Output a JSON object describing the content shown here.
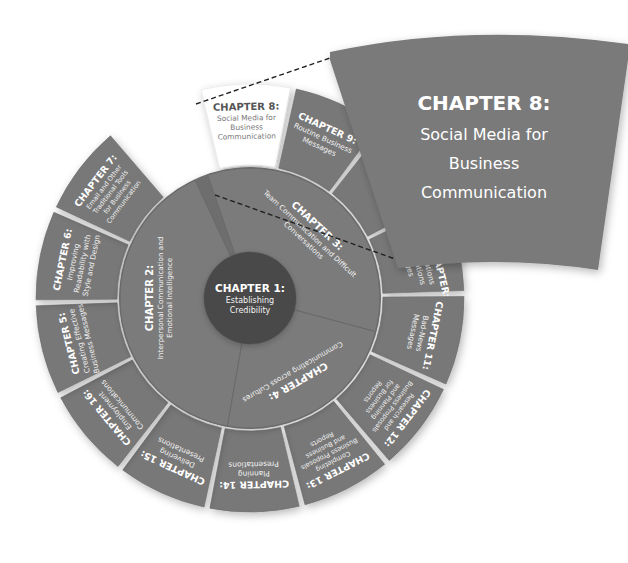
{
  "colors": {
    "center": "#4a4a4a",
    "middle_ring": "#7b7b7b",
    "outer_tile": "#787878",
    "highlight_tile": "#ffffff",
    "callout": "#7a7a7a",
    "text_light": "#ffffff",
    "text_dark": "#555555",
    "dashed_line": "#222222"
  },
  "center": {
    "title": "CHAPTER 1:",
    "lines": [
      "Establishing",
      "Credibility"
    ]
  },
  "middle_ring": [
    {
      "id": "ch2",
      "title": "CHAPTER 2:",
      "lines": [
        "Interpersonal Communication and",
        "Emotional Intelligence"
      ]
    },
    {
      "id": "ch3",
      "title": "CHAPTER 3:",
      "lines": [
        "Team Communication and Difficult",
        "Conversations"
      ]
    },
    {
      "id": "ch4",
      "title": "CHAPTER 4:",
      "lines": [
        "Communicating across Cultures"
      ]
    }
  ],
  "outer_ring": [
    {
      "id": "ch8",
      "title": "CHAPTER 8:",
      "lines": [
        "Social Media for",
        "Business",
        "Communication"
      ],
      "highlighted": true
    },
    {
      "id": "ch9",
      "title": "CHAPTER 9:",
      "lines": [
        "Routine Business",
        "Messages"
      ]
    },
    {
      "id": "ch10",
      "title": "",
      "lines": []
    },
    {
      "id": "bonus",
      "title": "BONUS CHAPTER:",
      "lines": [
        "Communications",
        "Public Relations",
        "Messages"
      ]
    },
    {
      "id": "ch11",
      "title": "CHAPTER 11:",
      "lines": [
        "Bad-News",
        "Messages"
      ]
    },
    {
      "id": "ch12",
      "title": "CHAPTER 12:",
      "lines": [
        "Research and",
        "Business Proposals",
        "and Planning",
        "for Business",
        "Reports"
      ]
    },
    {
      "id": "ch13",
      "title": "CHAPTER 13:",
      "lines": [
        "Completing",
        "Business Proposals",
        "and Business",
        "Reports"
      ]
    },
    {
      "id": "ch14",
      "title": "CHAPTER 14:",
      "lines": [
        "Planning",
        "Presentations"
      ]
    },
    {
      "id": "ch15",
      "title": "CHAPTER 15:",
      "lines": [
        "Delivering",
        "Presentations"
      ]
    },
    {
      "id": "ch16",
      "title": "CHAPTER 16:",
      "lines": [
        "Employment",
        "Communications"
      ]
    },
    {
      "id": "ch5",
      "title": "CHAPTER 5:",
      "lines": [
        "Creating Effective",
        "Business Messages"
      ]
    },
    {
      "id": "ch6",
      "title": "CHAPTER 6:",
      "lines": [
        "Improving",
        "Readability with",
        "Style and Design"
      ]
    },
    {
      "id": "ch7",
      "title": "CHAPTER 7:",
      "lines": [
        "Email and Other",
        "Traditional Tools",
        "for Business",
        "Communication"
      ]
    }
  ],
  "callout": {
    "title": "CHAPTER 8:",
    "lines": [
      "Social Media for",
      "Business",
      "Communication"
    ]
  }
}
